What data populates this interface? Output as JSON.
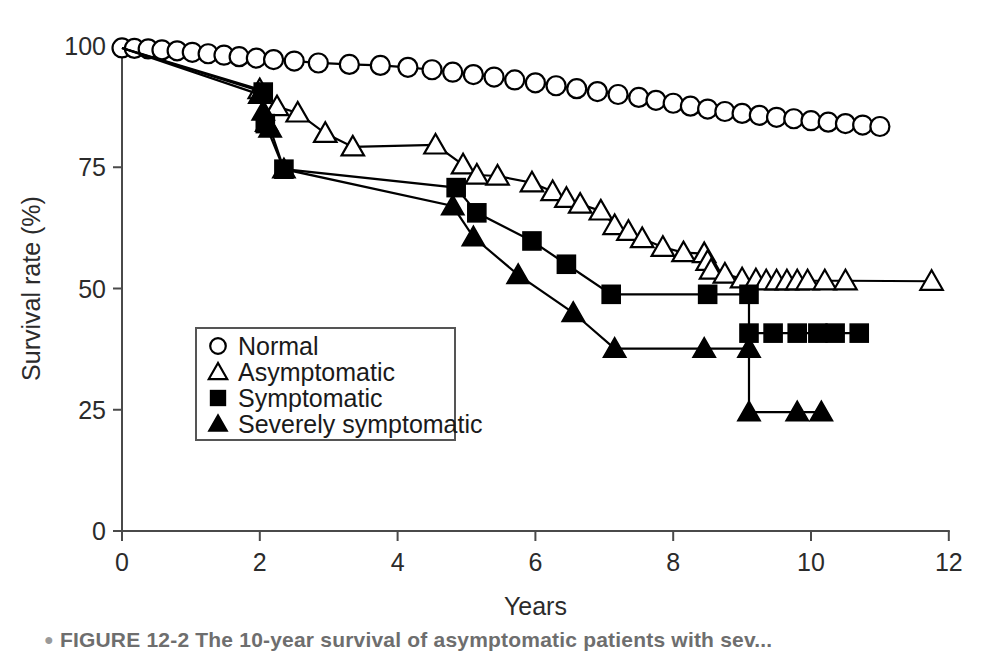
{
  "figure": {
    "caption_bullet": "●",
    "caption": "FIGURE 12-2   The 10-year survival of asymptomatic patients with sev..."
  },
  "chart_data": {
    "type": "line",
    "title": "",
    "xlabel": "Years",
    "ylabel": "Survival rate (%)",
    "xlim": [
      0,
      12
    ],
    "ylim": [
      0,
      100
    ],
    "xticks": [
      0,
      2,
      4,
      6,
      8,
      10,
      12
    ],
    "yticks": [
      0,
      25,
      50,
      75,
      100
    ],
    "xtick_labels": [
      "0",
      "2",
      "4",
      "6",
      "8",
      "10",
      "12"
    ],
    "ytick_labels": [
      "0",
      "25",
      "50",
      "75",
      "100"
    ],
    "grid": false,
    "legend_position": "center-left",
    "series": [
      {
        "name": "Normal",
        "marker": "circle-open",
        "label": "Normal",
        "points": [
          [
            0.0,
            99.6
          ],
          [
            0.18,
            99.5
          ],
          [
            0.38,
            99.4
          ],
          [
            0.58,
            99.2
          ],
          [
            0.8,
            99.0
          ],
          [
            1.02,
            98.7
          ],
          [
            1.25,
            98.4
          ],
          [
            1.48,
            98.1
          ],
          [
            1.7,
            97.8
          ],
          [
            1.95,
            97.5
          ],
          [
            2.2,
            97.2
          ],
          [
            2.5,
            96.9
          ],
          [
            2.85,
            96.5
          ],
          [
            3.3,
            96.2
          ],
          [
            3.75,
            96.0
          ],
          [
            4.15,
            95.6
          ],
          [
            4.5,
            95.1
          ],
          [
            4.8,
            94.6
          ],
          [
            5.1,
            94.1
          ],
          [
            5.4,
            93.6
          ],
          [
            5.7,
            93.0
          ],
          [
            6.0,
            92.4
          ],
          [
            6.3,
            91.8
          ],
          [
            6.6,
            91.2
          ],
          [
            6.9,
            90.6
          ],
          [
            7.2,
            90.0
          ],
          [
            7.5,
            89.4
          ],
          [
            7.75,
            88.8
          ],
          [
            8.0,
            88.2
          ],
          [
            8.25,
            87.6
          ],
          [
            8.5,
            87.0
          ],
          [
            8.75,
            86.5
          ],
          [
            9.0,
            86.1
          ],
          [
            9.25,
            85.7
          ],
          [
            9.5,
            85.3
          ],
          [
            9.75,
            85.0
          ],
          [
            10.0,
            84.6
          ],
          [
            10.25,
            84.3
          ],
          [
            10.5,
            84.0
          ],
          [
            10.75,
            83.7
          ],
          [
            11.0,
            83.4
          ]
        ]
      },
      {
        "name": "Asymptomatic",
        "marker": "triangle-open",
        "label": "Asymptomatic",
        "points": [
          [
            0.0,
            99.6
          ],
          [
            2.0,
            91.0
          ],
          [
            2.25,
            87.5
          ],
          [
            2.55,
            86.2
          ],
          [
            2.95,
            82.0
          ],
          [
            3.35,
            79.2
          ],
          [
            4.55,
            79.6
          ],
          [
            4.95,
            75.5
          ],
          [
            5.15,
            73.4
          ],
          [
            5.45,
            73.2
          ],
          [
            5.95,
            71.8
          ],
          [
            6.25,
            70.0
          ],
          [
            6.45,
            68.6
          ],
          [
            6.65,
            67.4
          ],
          [
            6.95,
            66.0
          ],
          [
            7.15,
            63.0
          ],
          [
            7.35,
            61.8
          ],
          [
            7.55,
            60.3
          ],
          [
            7.85,
            58.5
          ],
          [
            8.15,
            57.4
          ],
          [
            8.45,
            57.2
          ],
          [
            8.5,
            55.6
          ],
          [
            8.55,
            53.8
          ],
          [
            8.75,
            53.0
          ],
          [
            9.0,
            52.0
          ],
          [
            9.2,
            51.8
          ],
          [
            9.35,
            51.6
          ],
          [
            9.5,
            51.6
          ],
          [
            9.65,
            51.6
          ],
          [
            9.8,
            51.6
          ],
          [
            9.95,
            51.6
          ],
          [
            10.2,
            51.6
          ],
          [
            10.5,
            51.6
          ],
          [
            11.75,
            51.5
          ]
        ]
      },
      {
        "name": "Symptomatic",
        "marker": "square-filled",
        "label": "Symptomatic",
        "points": [
          [
            0.0,
            99.6
          ],
          [
            2.05,
            90.5
          ],
          [
            2.08,
            84.0
          ],
          [
            2.35,
            74.6
          ],
          [
            4.85,
            70.8
          ],
          [
            5.15,
            65.6
          ],
          [
            5.95,
            59.8
          ],
          [
            6.45,
            55.0
          ],
          [
            7.1,
            48.8
          ],
          [
            8.5,
            48.8
          ],
          [
            9.1,
            48.8
          ],
          [
            9.1,
            40.8
          ],
          [
            9.45,
            40.8
          ],
          [
            9.8,
            40.8
          ],
          [
            10.1,
            40.8
          ],
          [
            10.35,
            40.8
          ],
          [
            10.7,
            40.8
          ]
        ]
      },
      {
        "name": "Severely symptomatic",
        "marker": "triangle-filled",
        "label": "Severely symptomatic",
        "points": [
          [
            0.0,
            99.6
          ],
          [
            2.0,
            90.0
          ],
          [
            2.05,
            86.5
          ],
          [
            2.1,
            84.2
          ],
          [
            2.15,
            83.0
          ],
          [
            2.35,
            74.6
          ],
          [
            4.8,
            67.0
          ],
          [
            5.1,
            60.6
          ],
          [
            5.75,
            52.8
          ],
          [
            6.55,
            45.0
          ],
          [
            7.15,
            37.6
          ],
          [
            8.45,
            37.6
          ],
          [
            9.1,
            37.6
          ],
          [
            9.1,
            24.5
          ],
          [
            9.8,
            24.5
          ],
          [
            10.15,
            24.5
          ]
        ]
      }
    ]
  }
}
